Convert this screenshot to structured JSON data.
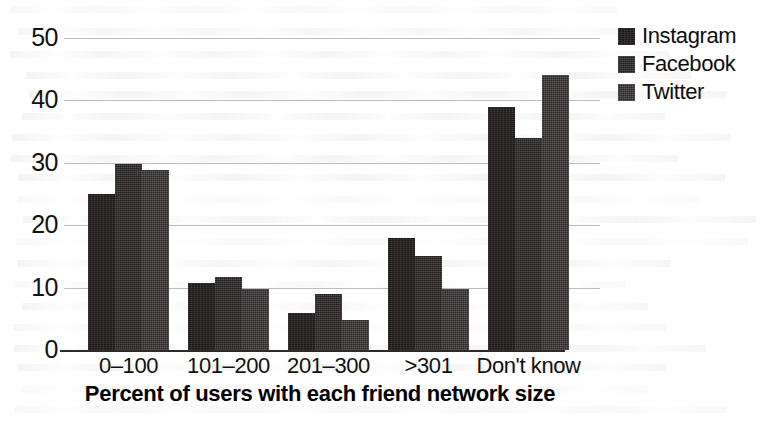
{
  "chart_data": {
    "type": "bar",
    "title": "",
    "xlabel": "Percent of users with each friend network size",
    "ylabel": "",
    "categories": [
      "0–100",
      "101–200",
      "201–300",
      ">301",
      "Don't know"
    ],
    "series": [
      {
        "name": "Instagram",
        "color": "#241f1f",
        "values": [
          25,
          10.7,
          6,
          18,
          39
        ]
      },
      {
        "name": "Facebook",
        "color": "#2b2626",
        "values": [
          29.8,
          11.7,
          9,
          15,
          34
        ]
      },
      {
        "name": "Twitter",
        "color": "#332d2d",
        "values": [
          28.8,
          9.7,
          4.8,
          9.7,
          44
        ]
      }
    ],
    "ylim": [
      0,
      50
    ],
    "yticks": [
      0,
      10,
      20,
      30,
      40,
      50
    ],
    "ytick_labels": [
      "0",
      "10",
      "20",
      "30",
      "40",
      "50"
    ],
    "grid": true,
    "grid_color": "#b9bcc4",
    "legend_position": "top-right",
    "axis_color": "#2a2a2a",
    "background": "#ffffff"
  }
}
